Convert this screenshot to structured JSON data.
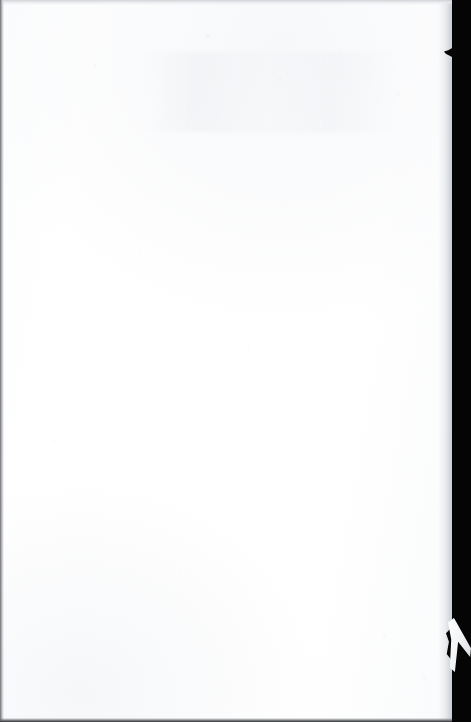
{
  "document": {
    "type": "scanned-page",
    "page_label": "",
    "body_text": "",
    "content_state": "blank",
    "caption": "Blank scanned page"
  },
  "scan": {
    "background_label": "scanner-backdrop",
    "paper_label": "paper-sheet",
    "grain_label": "paper-grain",
    "ghost_label": "bleed-through-smudge",
    "vignette_label": "scan-vignette"
  },
  "edges": {
    "left_label": "left-edge-line",
    "top_label": "top-edge-line",
    "bottom_label": "bottom-edge-line",
    "right_label": "right-edge-shadow",
    "notch_label": "edge-notch",
    "flap_label": "torn-paper-flap",
    "gap_label": "tear-gap"
  },
  "colors": {
    "backdrop": "#050505",
    "paper": "#ffffff",
    "paper_tint": "#fbfcfd",
    "edge_dark": "#1d1f22",
    "edge_grey": "#9fa2a7",
    "shadow": "#c4c8ce"
  },
  "geometry": {
    "width": 471,
    "height": 722,
    "paper_width": 452,
    "paper_height": 722
  }
}
